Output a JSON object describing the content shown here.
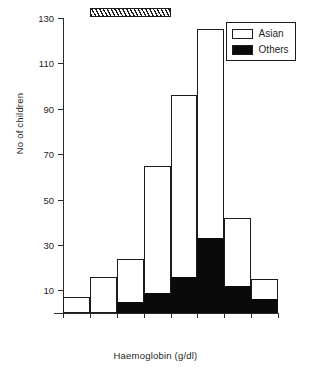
{
  "chart_data": {
    "type": "bar",
    "subtype": "stacked-histogram",
    "title": "",
    "xlabel": "Haemoglobin (g/dl)",
    "ylabel": "No of children",
    "xlim": [
      7,
      15
    ],
    "ylim": [
      0,
      130
    ],
    "grid": false,
    "xticks": [
      "7",
      "8",
      "9",
      "10",
      "11",
      "12",
      "13",
      "14",
      "15"
    ],
    "yticks": [
      "10",
      "30",
      "50",
      "70",
      "90",
      "110",
      "130"
    ],
    "bin_edges": [
      7,
      8,
      9,
      10,
      11,
      12,
      13,
      14,
      15
    ],
    "bin_labels": [
      "7-8",
      "8-9",
      "9-10",
      "10-11",
      "11-12",
      "12-13",
      "13-14",
      "14-15"
    ],
    "categories": [
      "7-8",
      "8-9",
      "9-10",
      "10-11",
      "11-12",
      "12-13",
      "13-14",
      "14-15"
    ],
    "series": [
      {
        "name": "Asian",
        "color": "#ffffff",
        "edge_color": "#1c1c1c",
        "values": [
          7,
          16,
          19,
          56,
          80,
          92,
          30,
          9
        ]
      },
      {
        "name": "Others",
        "color": "#0a0a0a",
        "edge_color": "#0a0a0a",
        "values": [
          0,
          0,
          5,
          9,
          16,
          33,
          12,
          6
        ]
      }
    ],
    "totals": [
      7,
      16,
      24,
      65,
      96,
      125,
      42,
      15
    ],
    "legend": {
      "position": "top-right",
      "entries": [
        {
          "label": "Asian",
          "swatch": "white-outlined"
        },
        {
          "label": "Others",
          "swatch": "black-filled"
        }
      ]
    },
    "annotations": [
      {
        "name": "normal-range-marker",
        "style": "hatched-bar",
        "x_start": 8.0,
        "x_end": 11.0,
        "y": 130
      }
    ]
  }
}
